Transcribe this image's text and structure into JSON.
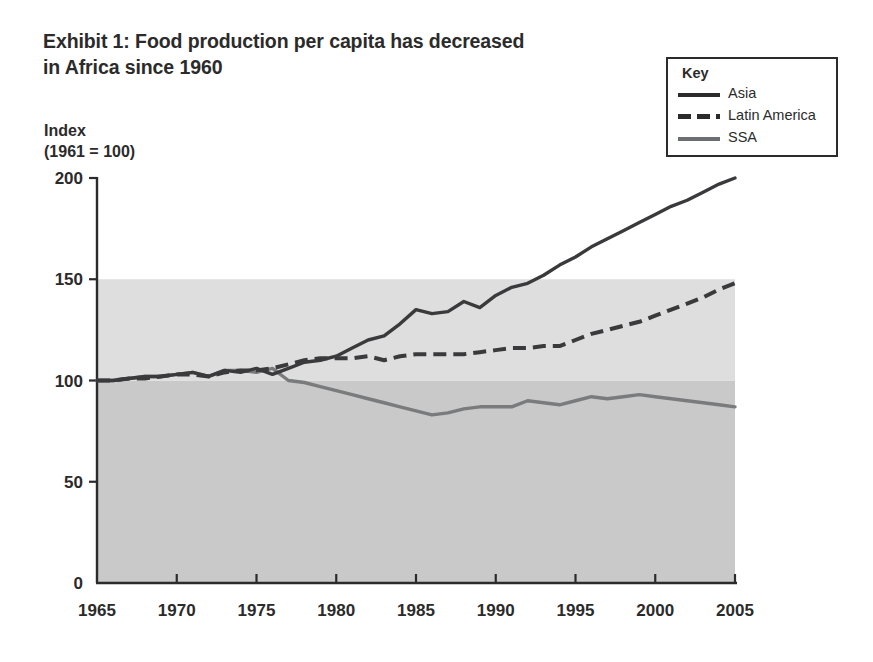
{
  "title": {
    "line1": "Exhibit 1: Food production per capita has decreased",
    "line2": "in Africa since 1960"
  },
  "axis_caption": {
    "line1": "Index",
    "line2": "(1961 = 100)"
  },
  "legend": {
    "heading": "Key",
    "items": [
      {
        "label": "Asia",
        "style": "solid",
        "color": "#3a3a3c"
      },
      {
        "label": "Latin America",
        "style": "dashed",
        "color": "#3a3a3c"
      },
      {
        "label": "SSA",
        "style": "solid",
        "color": "#7a7b7d"
      }
    ]
  },
  "chart_data": {
    "type": "line",
    "title": "Exhibit 1: Food production per capita has decreased in Africa since 1960",
    "xlabel": "",
    "ylabel": "Index (1961 = 100)",
    "xlim": [
      1965,
      2005
    ],
    "ylim": [
      0,
      200
    ],
    "xticks": [
      1965,
      1970,
      1975,
      1980,
      1985,
      1990,
      1995,
      2000,
      2005
    ],
    "yticks": [
      0,
      50,
      100,
      150,
      200
    ],
    "xtick_labels": [
      "1965",
      "1970",
      "1975",
      "1980",
      "1985",
      "1990",
      "1995",
      "2000",
      "2005"
    ],
    "ytick_labels": [
      "0",
      "50",
      "100",
      "150",
      "200"
    ],
    "grid": false,
    "legend_position": "top-right",
    "x": [
      1965,
      1966,
      1967,
      1968,
      1969,
      1970,
      1971,
      1972,
      1973,
      1974,
      1975,
      1976,
      1977,
      1978,
      1979,
      1980,
      1981,
      1982,
      1983,
      1984,
      1985,
      1986,
      1987,
      1988,
      1989,
      1990,
      1991,
      1992,
      1993,
      1994,
      1995,
      1996,
      1997,
      1998,
      1999,
      2000,
      2001,
      2002,
      2003,
      2004,
      2005
    ],
    "series": [
      {
        "name": "Asia",
        "style": "solid",
        "color": "#3a3a3c",
        "values": [
          100,
          100,
          101,
          102,
          102,
          103,
          104,
          102,
          105,
          104,
          106,
          103,
          106,
          109,
          110,
          112,
          116,
          120,
          122,
          128,
          135,
          133,
          134,
          139,
          136,
          142,
          146,
          148,
          152,
          157,
          161,
          166,
          170,
          174,
          178,
          182,
          186,
          189,
          193,
          197,
          200
        ]
      },
      {
        "name": "Latin America",
        "style": "dashed",
        "color": "#3a3a3c",
        "values": [
          100,
          100,
          101,
          101,
          102,
          103,
          103,
          102,
          104,
          105,
          105,
          106,
          108,
          110,
          111,
          111,
          111,
          112,
          110,
          112,
          113,
          113,
          113,
          113,
          114,
          115,
          116,
          116,
          117,
          117,
          120,
          123,
          125,
          127,
          129,
          132,
          135,
          138,
          141,
          145,
          148
        ]
      },
      {
        "name": "SSA",
        "style": "solid",
        "color": "#7a7b7d",
        "values": [
          100,
          100,
          101,
          102,
          102,
          103,
          104,
          102,
          105,
          105,
          104,
          106,
          100,
          99,
          97,
          95,
          93,
          91,
          89,
          87,
          85,
          83,
          84,
          86,
          87,
          87,
          87,
          90,
          89,
          88,
          90,
          92,
          91,
          92,
          93,
          92,
          91,
          90,
          89,
          88,
          87
        ]
      }
    ],
    "background_bands": [
      {
        "from": 0,
        "to": 100,
        "shade": "#c9c9c9"
      },
      {
        "from": 100,
        "to": 150,
        "shade": "#dedede"
      },
      {
        "from": 150,
        "to": 200,
        "shade": "#ffffff"
      }
    ]
  }
}
